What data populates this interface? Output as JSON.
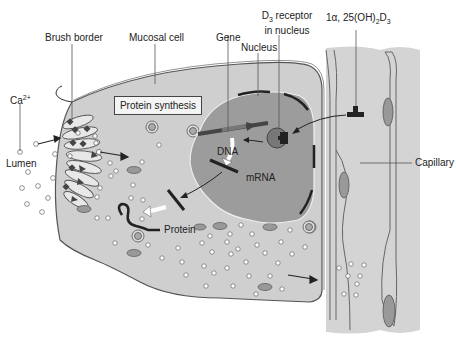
{
  "diagram": {
    "labels": {
      "brush_border": "Brush border",
      "mucosal_cell": "Mucosal cell",
      "gene": "Gene",
      "nucleus": "Nucleus",
      "d3_receptor_line1": "D3 receptor",
      "d3_receptor_line2": "in nucleus",
      "calcitriol": "1α, 25(OH)2D3",
      "capillary": "Capillary",
      "ca_ion": "Ca2+",
      "lumen": "Lumen",
      "protein_synthesis": "Protein synthesis",
      "dna": "DNA",
      "mrna": "mRNA",
      "protein": "Protein"
    },
    "colors": {
      "cell_fill": "#cfcfcf",
      "nucleus_fill": "#9c9c9c",
      "capillary_fill": "#d4d4d4",
      "outline": "#555555",
      "dark": "#222222",
      "organelle": "#8a8a8a"
    }
  }
}
